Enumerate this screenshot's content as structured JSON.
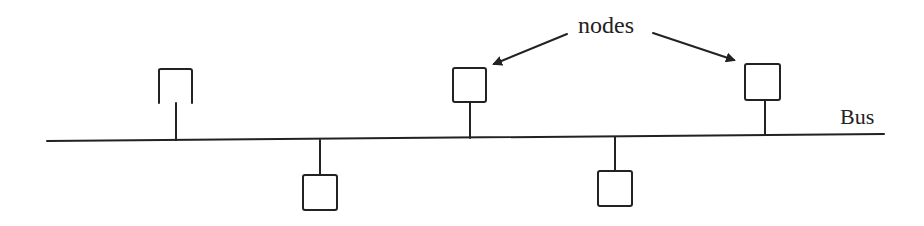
{
  "diagram": {
    "labels": {
      "nodes": "nodes",
      "bus": "Bus"
    },
    "colors": {
      "stroke": "#222222",
      "background": "#ffffff"
    },
    "nodes": [
      {
        "id": "node-1",
        "side": "above",
        "shape": "open-bottom box",
        "annotated": false
      },
      {
        "id": "node-2",
        "side": "below",
        "shape": "box",
        "annotated": false
      },
      {
        "id": "node-3",
        "side": "above",
        "shape": "box",
        "annotated": true
      },
      {
        "id": "node-4",
        "side": "below",
        "shape": "box",
        "annotated": false
      },
      {
        "id": "node-5",
        "side": "above",
        "shape": "box",
        "annotated": true
      }
    ],
    "arrows": [
      {
        "from": "nodes-label",
        "to": "node-3"
      },
      {
        "from": "nodes-label",
        "to": "node-5"
      }
    ]
  }
}
